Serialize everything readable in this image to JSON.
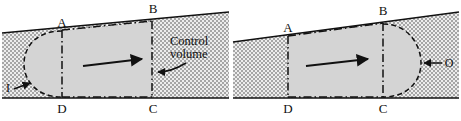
{
  "figure": {
    "panels": [
      {
        "id": "left-panel",
        "name": "inlet-control-volume",
        "corner_labels": {
          "top_left": "A",
          "top_right": "B",
          "bottom_right": "C",
          "bottom_left": "D"
        },
        "annotations": [
          {
            "name": "inlet-label",
            "text": "I"
          },
          {
            "name": "control-volume-label-line1",
            "text": "Control"
          },
          {
            "name": "control-volume-label-line2",
            "text": "volume"
          }
        ],
        "flow_arrow": {
          "name": "flow-direction-arrow",
          "direction": "right"
        }
      },
      {
        "id": "right-panel",
        "name": "outlet-control-volume",
        "corner_labels": {
          "top_left": "A",
          "top_right": "B",
          "bottom_right": "C",
          "bottom_left": "D"
        },
        "annotations": [
          {
            "name": "outlet-label",
            "text": "O"
          }
        ],
        "flow_arrow": {
          "name": "flow-direction-arrow",
          "direction": "right"
        }
      }
    ],
    "colors": {
      "line": "#111111",
      "control_volume_fill": "#d4d4d4",
      "stipple_background": "#e9e9e9",
      "stipple_dot": "#9a9a9a",
      "page_background": "#ffffff"
    },
    "line_styles": {
      "boundary_solid": "solid",
      "control_volume_chain": "dash-dot",
      "bulge_dashed": "dashed"
    }
  }
}
